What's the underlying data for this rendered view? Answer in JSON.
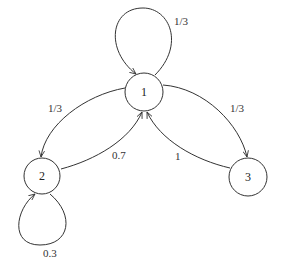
{
  "diagram": {
    "type": "markov-chain",
    "nodes": [
      {
        "id": "1",
        "label": "1"
      },
      {
        "id": "2",
        "label": "2"
      },
      {
        "id": "3",
        "label": "3"
      }
    ],
    "edges": [
      {
        "from": "1",
        "to": "1",
        "label": "1/3"
      },
      {
        "from": "1",
        "to": "2",
        "label": "1/3"
      },
      {
        "from": "1",
        "to": "3",
        "label": "1/3"
      },
      {
        "from": "2",
        "to": "1",
        "label": "0.7"
      },
      {
        "from": "2",
        "to": "2",
        "label": "0.3"
      },
      {
        "from": "3",
        "to": "1",
        "label": "1"
      }
    ]
  }
}
